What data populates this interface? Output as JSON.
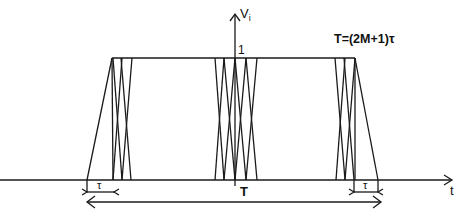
{
  "diagram": {
    "axes": {
      "vertical_label_main": "V",
      "vertical_label_sub": "i",
      "horizontal_label": "t",
      "level_label": "1"
    },
    "labels": {
      "period_formula": "T=(2M+1)τ",
      "period": "T",
      "tau_left": "τ",
      "tau_right": "τ"
    },
    "colors": {
      "line": "#1a1a1a",
      "background": "#ffffff"
    }
  }
}
